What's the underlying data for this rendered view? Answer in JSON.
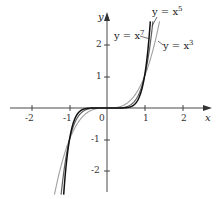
{
  "chart_data": {
    "type": "line",
    "title": "",
    "xlabel": "x",
    "ylabel": "y",
    "xlim": [
      -2.6,
      2.6
    ],
    "ylim": [
      -2.8,
      2.6
    ],
    "grid": false,
    "x_ticks": [
      "-2",
      "-1",
      "0",
      "1",
      "2"
    ],
    "y_ticks": [
      "2",
      "1",
      "-1",
      "-2"
    ],
    "origin_label": "0",
    "series": [
      {
        "name": "y = x^3",
        "exponent": 3,
        "color": "#9a9a9a",
        "label": "y = x",
        "sup": "3"
      },
      {
        "name": "y = x^5",
        "exponent": 5,
        "color": "#5a5a5a",
        "label": "y = x",
        "sup": "5"
      },
      {
        "name": "y = x^7",
        "exponent": 7,
        "color": "#111111",
        "label": "y = x",
        "sup": "7"
      }
    ]
  }
}
